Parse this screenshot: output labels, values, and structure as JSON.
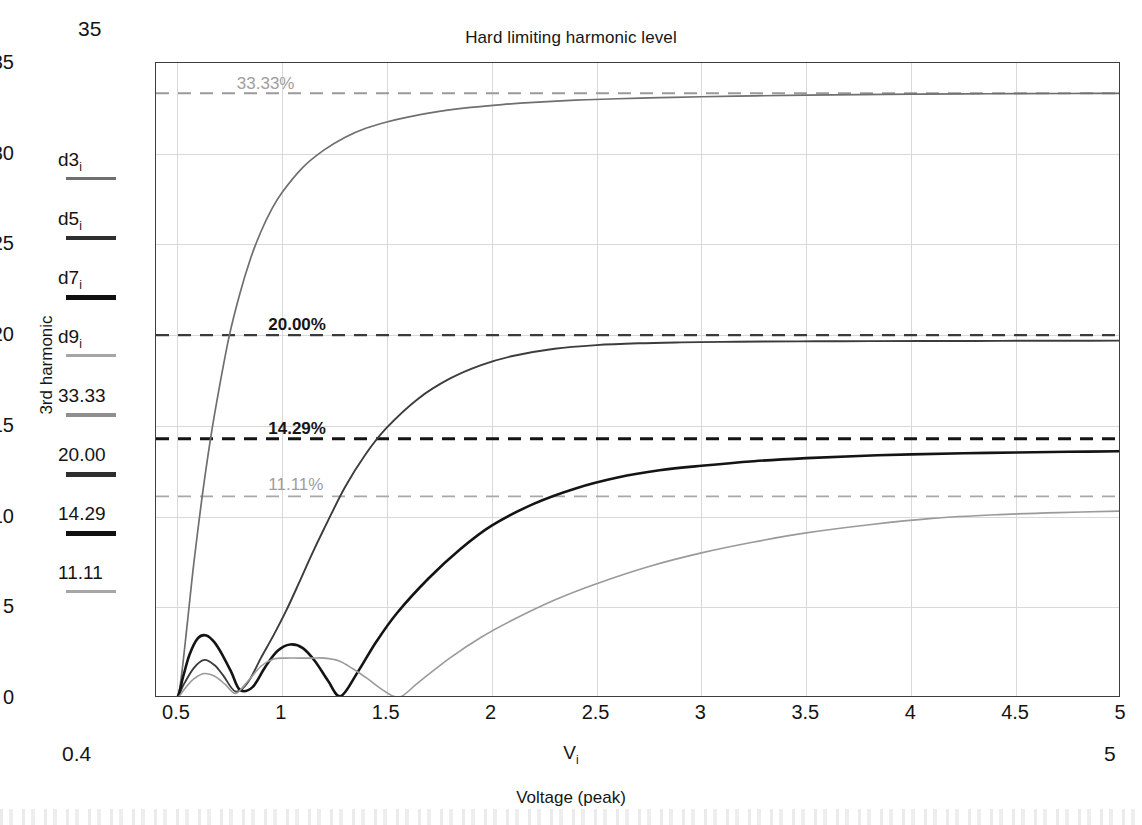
{
  "chart_data": {
    "type": "line",
    "title": "Hard limiting harmonic level",
    "xlabel": "Voltage (peak)",
    "xvar": "V",
    "xvar_sub": "i",
    "ylabel": "3rd harmonic",
    "xlim": [
      0.4,
      5
    ],
    "ylim": [
      0,
      35
    ],
    "grid": true,
    "legend_position": "left-outside",
    "xticks": [
      "0.5",
      "1",
      "1.5",
      "2",
      "2.5",
      "3",
      "3.5",
      "4",
      "4.5",
      "5"
    ],
    "xtick_values": [
      0.5,
      1,
      1.5,
      2,
      2.5,
      3,
      3.5,
      4,
      4.5,
      5
    ],
    "yticks": [
      "0",
      "5",
      "10",
      "15",
      "20",
      "25",
      "30",
      "35"
    ],
    "ytick_values": [
      0,
      5,
      10,
      15,
      20,
      25,
      30,
      35
    ],
    "corner_notes": {
      "ymax": "35",
      "xmin": "0.4",
      "xmax": "5"
    },
    "reference_lines": [
      {
        "name": "33.33",
        "label": "33.33%",
        "value": 33.33,
        "color": "#9a9a9a",
        "width": 2.1,
        "bold": false,
        "label_x": 0.79,
        "label_y": 34.35
      },
      {
        "name": "20.00",
        "label": "20.00%",
        "value": 20.0,
        "color": "#3a3a3a",
        "width": 2.4,
        "bold": true,
        "label_x": 0.94,
        "label_y": 21.05
      },
      {
        "name": "14.29",
        "label": "14.29%",
        "value": 14.29,
        "color": "#141414",
        "width": 3.0,
        "bold": true,
        "label_x": 0.94,
        "label_y": 15.35
      },
      {
        "name": "11.11",
        "label": "11.11%",
        "value": 11.11,
        "color": "#a8a8a8",
        "width": 1.8,
        "bold": false,
        "label_x": 0.94,
        "label_y": 12.25
      }
    ],
    "series": [
      {
        "name": "d3",
        "legend_label": "d3",
        "legend_sub": "i",
        "color": "#6f6f6f",
        "width": 1.7,
        "asymptote": 33.33,
        "x": [
          0.4,
          0.45,
          0.5,
          0.52,
          0.55,
          0.58,
          0.62,
          0.66,
          0.7,
          0.75,
          0.8,
          0.85,
          0.9,
          0.95,
          1.0,
          1.1,
          1.2,
          1.3,
          1.4,
          1.5,
          1.6,
          1.75,
          1.9,
          2.05,
          2.2,
          2.4,
          2.6,
          2.8,
          3.0,
          3.25,
          3.5,
          3.75,
          4.0,
          4.25,
          4.5,
          4.75,
          5.0
        ],
        "y": [
          0.0,
          0.0,
          0.0,
          1.1,
          4.2,
          7.4,
          11.1,
          14.3,
          17.0,
          20.0,
          22.3,
          24.2,
          25.7,
          26.9,
          27.85,
          29.25,
          30.2,
          30.9,
          31.4,
          31.75,
          32.02,
          32.33,
          32.55,
          32.71,
          32.83,
          32.95,
          33.03,
          33.09,
          33.14,
          33.19,
          33.23,
          33.26,
          33.28,
          33.3,
          33.31,
          33.32,
          33.33
        ]
      },
      {
        "name": "d5",
        "legend_label": "d5",
        "legend_sub": "i",
        "color": "#3c3c3c",
        "width": 1.9,
        "asymptote": 19.7,
        "x": [
          0.4,
          0.45,
          0.5,
          0.53,
          0.58,
          0.63,
          0.68,
          0.72,
          0.78,
          0.84,
          0.9,
          0.96,
          1.02,
          1.08,
          1.14,
          1.2,
          1.3,
          1.4,
          1.5,
          1.65,
          1.8,
          1.95,
          2.1,
          2.3,
          2.5,
          2.7,
          2.9,
          3.1,
          3.3,
          3.55,
          3.8,
          4.05,
          4.3,
          4.55,
          4.8,
          5.0
        ],
        "y": [
          0.0,
          0.0,
          0.0,
          0.7,
          1.65,
          2.1,
          1.8,
          1.25,
          0.35,
          0.9,
          2.2,
          3.45,
          4.8,
          6.3,
          7.85,
          9.3,
          11.6,
          13.45,
          14.9,
          16.5,
          17.6,
          18.35,
          18.85,
          19.25,
          19.45,
          19.55,
          19.6,
          19.63,
          19.65,
          19.66,
          19.67,
          19.68,
          19.68,
          19.69,
          19.69,
          19.7
        ]
      },
      {
        "name": "d7",
        "legend_label": "d7",
        "legend_sub": "i",
        "color": "#141414",
        "width": 2.6,
        "asymptote": 13.6,
        "x": [
          0.4,
          0.45,
          0.5,
          0.53,
          0.56,
          0.6,
          0.64,
          0.68,
          0.72,
          0.76,
          0.8,
          0.86,
          0.92,
          0.98,
          1.04,
          1.1,
          1.16,
          1.22,
          1.28,
          1.36,
          1.45,
          1.55,
          1.7,
          1.85,
          2.0,
          2.2,
          2.4,
          2.6,
          2.8,
          3.0,
          3.25,
          3.5,
          3.75,
          4.0,
          4.25,
          4.5,
          4.75,
          5.0
        ],
        "y": [
          0.0,
          0.0,
          0.0,
          1.2,
          2.4,
          3.3,
          3.45,
          3.05,
          2.3,
          1.4,
          0.45,
          0.6,
          1.7,
          2.6,
          2.95,
          2.75,
          2.0,
          0.95,
          0.1,
          1.4,
          3.1,
          4.7,
          6.6,
          8.2,
          9.5,
          10.7,
          11.55,
          12.15,
          12.55,
          12.8,
          13.05,
          13.22,
          13.34,
          13.43,
          13.49,
          13.53,
          13.57,
          13.6
        ]
      },
      {
        "name": "d9",
        "legend_label": "d9",
        "legend_sub": "i",
        "color": "#9a9a9a",
        "width": 1.6,
        "asymptote": 10.3,
        "x": [
          0.4,
          0.45,
          0.5,
          0.54,
          0.58,
          0.63,
          0.68,
          0.73,
          0.78,
          0.84,
          0.9,
          0.96,
          1.02,
          1.08,
          1.14,
          1.2,
          1.27,
          1.34,
          1.41,
          1.48,
          1.56,
          1.65,
          1.8,
          1.95,
          2.1,
          2.3,
          2.5,
          2.75,
          3.0,
          3.25,
          3.5,
          3.8,
          4.1,
          4.4,
          4.7,
          5.0
        ],
        "y": [
          0.0,
          0.0,
          0.0,
          0.55,
          1.05,
          1.35,
          1.2,
          0.75,
          0.25,
          0.95,
          1.75,
          2.15,
          2.2,
          2.2,
          2.2,
          2.2,
          2.05,
          1.6,
          1.05,
          0.45,
          0.05,
          0.85,
          2.2,
          3.35,
          4.3,
          5.4,
          6.3,
          7.25,
          8.0,
          8.6,
          9.1,
          9.55,
          9.9,
          10.1,
          10.22,
          10.3
        ]
      }
    ],
    "legend_items": [
      {
        "name": "d3",
        "label": "d3",
        "sub": "i",
        "color": "#6f6f6f",
        "width": 3
      },
      {
        "name": "d5",
        "label": "d5",
        "sub": "i",
        "color": "#2e2e2e",
        "width": 4
      },
      {
        "name": "d7",
        "label": "d7",
        "sub": "i",
        "color": "#101010",
        "width": 5
      },
      {
        "name": "d9",
        "label": "d9",
        "sub": "i",
        "color": "#a6a6a6",
        "width": 3
      },
      {
        "name": "33.33",
        "label": "33.33",
        "sub": "",
        "color": "#8f8f8f",
        "width": 4
      },
      {
        "name": "20.00",
        "label": "20.00",
        "sub": "",
        "color": "#2e2e2e",
        "width": 5
      },
      {
        "name": "14.29",
        "label": "14.29",
        "sub": "",
        "color": "#101010",
        "width": 5
      },
      {
        "name": "11.11",
        "label": "11.11",
        "sub": "",
        "color": "#a6a6a6",
        "width": 3
      }
    ]
  }
}
